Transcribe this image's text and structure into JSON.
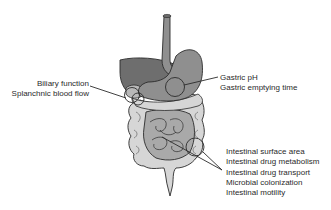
{
  "figure": {
    "colors": {
      "outline": "#2b2b2b",
      "liver": "#6e6e6e",
      "stomach": "#8f8f8f",
      "small_intestine": "#a9a9a9",
      "large_intestine": "#d6d6d6",
      "gallbladder": "#b8b8b8",
      "background": "#ffffff"
    }
  },
  "callouts": {
    "biliary": {
      "lines": [
        "Biliary function",
        "Splanchnic blood flow"
      ]
    },
    "gastric": {
      "lines": [
        "Gastric pH",
        "Gastric emptying time"
      ]
    },
    "intestinal": {
      "lines": [
        "Intestinal surface area",
        "Intestinal drug metabolism",
        "Intestinal drug transport",
        "Microbial colonization",
        "Intestinal motility"
      ]
    }
  }
}
